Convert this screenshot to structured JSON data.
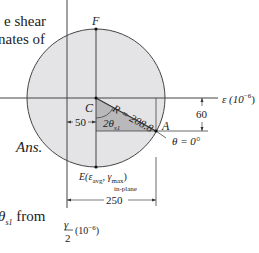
{
  "text_fragments": {
    "line1": "e shear",
    "line2": "nates of",
    "ans": "Ans.",
    "theta_from_sym": "θ",
    "theta_from_sub": "s1",
    "theta_from_word": "from"
  },
  "diagram": {
    "point_F": "F",
    "point_C": "C",
    "point_A": "A",
    "point_E": "E(ε",
    "point_E_sub": "avg",
    "point_E_mid": ", γ",
    "point_E_sub2": "max",
    "point_E_close": ")",
    "point_E_sub3": "in-plane",
    "radius_label": "R = 208.8",
    "angle_label": "2θ",
    "angle_sub": "s1",
    "theta_zero": "θ = 0°",
    "dim_50": "50",
    "dim_60": "60",
    "dim_250": "250",
    "eps_axis": "ε (10",
    "eps_axis_exp": "−6",
    "eps_axis_close": ")",
    "gamma_num": "γ",
    "gamma_den": "2",
    "gamma_unit": "(10",
    "gamma_unit_exp": "−6",
    "gamma_unit_close": ")"
  },
  "colors": {
    "circle_fill": "#e4e4e6",
    "triangle_fill": "#b9b9bc",
    "line": "#333333"
  }
}
